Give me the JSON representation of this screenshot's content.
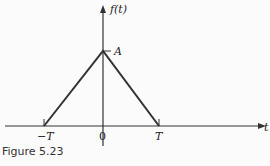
{
  "diagram": {
    "function_label": "f(t)",
    "x_axis_label": "t",
    "peak_label": "A",
    "ticks": {
      "neg": "−T",
      "zero": "0",
      "pos": "T"
    },
    "shape": "triangle",
    "points": [
      [
        -1,
        0
      ],
      [
        0,
        1
      ],
      [
        1,
        0
      ]
    ]
  },
  "caption": "Figure 5.23"
}
